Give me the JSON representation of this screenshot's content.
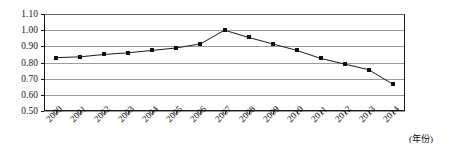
{
  "chart_data": {
    "type": "line",
    "title": "",
    "subtitle": "",
    "xlabel": "(年份)",
    "ylabel": "",
    "categories": [
      "2000",
      "2001",
      "2002",
      "2003",
      "2004",
      "2005",
      "2006",
      "2007",
      "2008",
      "2009",
      "2010",
      "2011",
      "2012",
      "2013",
      "2014"
    ],
    "x": [
      2000,
      2001,
      2002,
      2003,
      2004,
      2005,
      2006,
      2007,
      2008,
      2009,
      2010,
      2011,
      2012,
      2013,
      2014
    ],
    "values": [
      0.83,
      0.835,
      0.85,
      0.86,
      0.875,
      0.89,
      0.915,
      1.0,
      0.955,
      0.915,
      0.875,
      0.825,
      0.79,
      0.755,
      0.665
    ],
    "series": [
      {
        "name": "",
        "values": [
          0.83,
          0.835,
          0.85,
          0.86,
          0.875,
          0.89,
          0.915,
          1.0,
          0.955,
          0.915,
          0.875,
          0.825,
          0.79,
          0.755,
          0.665
        ]
      }
    ],
    "ylim": [
      0.5,
      1.1
    ],
    "ytick_labels": [
      "1.10",
      "1.00",
      "0.90",
      "0.80",
      "0.70",
      "0.60",
      "0.50"
    ],
    "ytick_values": [
      1.1,
      1.0,
      0.9,
      0.8,
      0.7,
      0.6,
      0.5
    ],
    "grid": true,
    "grid_axis": "y",
    "legend": false,
    "legend_position": "none",
    "marker": "square",
    "line_color": "#1a1a1a",
    "marker_color": "#0d0d0d",
    "grid_color": "#9a9a9a",
    "axis_color": "#1a1a1a",
    "background_color": "#ffffff",
    "xtick_rotation": -45,
    "annotations": []
  }
}
